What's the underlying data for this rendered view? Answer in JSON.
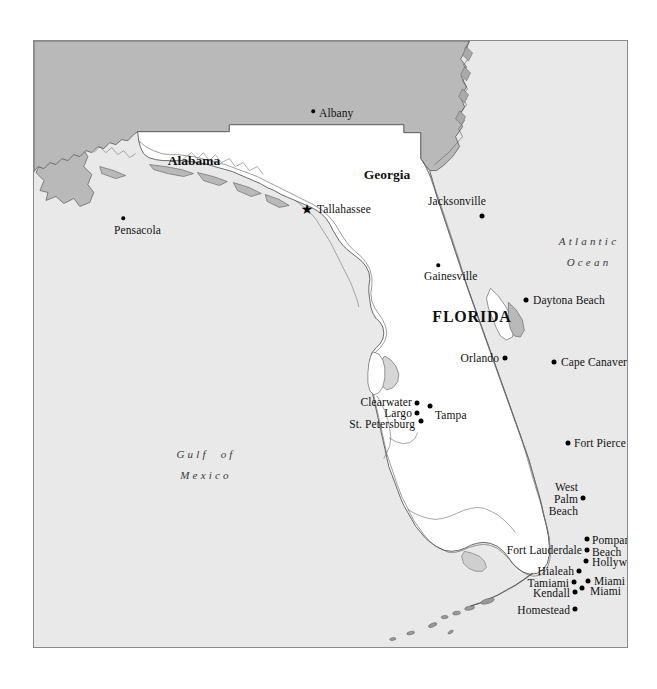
{
  "map": {
    "title": "Florida",
    "frame": {
      "x": 33,
      "y": 40,
      "width": 595,
      "height": 608
    },
    "colors": {
      "water": "#e9e9e9",
      "florida_land": "#ffffff",
      "neighbor_state": "#b9b9b9",
      "outline": "#595959",
      "frame_border": "#8a8a8a",
      "text": "#111111",
      "water_text": "#3a3a3a"
    },
    "state_labels": [
      {
        "name": "alabama",
        "text": "Alabama",
        "x": 160,
        "y": 112,
        "style": "neighbor"
      },
      {
        "name": "georgia",
        "text": "Georgia",
        "x": 353,
        "y": 126,
        "style": "neighbor"
      },
      {
        "name": "florida",
        "text": "FLORIDA",
        "x": 438,
        "y": 267,
        "style": "primary"
      }
    ],
    "water_labels": [
      {
        "name": "atlantic-ocean",
        "line1": "Atlantic",
        "line2": "Ocean",
        "x": 555,
        "y": 190
      },
      {
        "name": "gulf-of-mexico",
        "line1": "Gulf  of",
        "line2": "Mexico",
        "x": 172,
        "y": 403
      }
    ],
    "capital": {
      "name": "tallahassee",
      "label": "Tallahassee",
      "marker": "star",
      "dot_x": 273,
      "dot_y": 168,
      "label_x": 283,
      "label_y": 162,
      "align": "left"
    },
    "cities": [
      {
        "name": "albany",
        "label": "Albany",
        "dot_x": 279,
        "dot_y": 70,
        "label_x": 285,
        "label_y": 66,
        "align": "left",
        "size": "small"
      },
      {
        "name": "jacksonville",
        "label": "Jacksonville",
        "dot_x": 448,
        "dot_y": 175,
        "label_x": 394,
        "label_y": 154,
        "align": "left"
      },
      {
        "name": "pensacola",
        "label": "Pensacola",
        "dot_x": 89,
        "dot_y": 177,
        "label_x": 80,
        "label_y": 183,
        "align": "left",
        "size": "small"
      },
      {
        "name": "gainesville",
        "label": "Gainesville",
        "dot_x": 404,
        "dot_y": 224,
        "label_x": 390,
        "label_y": 229,
        "align": "left",
        "size": "small"
      },
      {
        "name": "daytona-beach",
        "label": "Daytona Beach",
        "dot_x": 492,
        "dot_y": 259,
        "label_x": 499,
        "label_y": 253,
        "align": "left"
      },
      {
        "name": "orlando",
        "label": "Orlando",
        "dot_x": 471,
        "dot_y": 317,
        "label_x": 465,
        "label_y": 311,
        "align": "right"
      },
      {
        "name": "cape-canaveral",
        "label": "Cape Canaveral",
        "dot_x": 520,
        "dot_y": 321,
        "label_x": 527,
        "label_y": 315,
        "align": "left"
      },
      {
        "name": "clearwater",
        "label": "Clearwater",
        "dot_x": 383,
        "dot_y": 362,
        "label_x": 378,
        "label_y": 355,
        "align": "right"
      },
      {
        "name": "tampa",
        "label": "Tampa",
        "dot_x": 396,
        "dot_y": 365,
        "label_x": 401,
        "label_y": 368,
        "align": "left"
      },
      {
        "name": "largo",
        "label": "Largo",
        "dot_x": 383,
        "dot_y": 372,
        "label_x": 378,
        "label_y": 366,
        "align": "right"
      },
      {
        "name": "st-petersburg",
        "label": "St. Petersburg",
        "dot_x": 387,
        "dot_y": 380,
        "label_x": 381,
        "label_y": 377,
        "align": "right"
      },
      {
        "name": "fort-pierce",
        "label": "Fort Pierce",
        "dot_x": 534,
        "dot_y": 402,
        "label_x": 540,
        "label_y": 396,
        "align": "left"
      },
      {
        "name": "west-palm-beach",
        "label": "West\nPalm\nBeach",
        "dot_x": 549,
        "dot_y": 457,
        "label_x": 544,
        "label_y": 440,
        "align": "right"
      },
      {
        "name": "pompano-beach",
        "label": "Pompano\nBeach",
        "dot_x": 553,
        "dot_y": 498,
        "label_x": 558,
        "label_y": 493,
        "align": "left"
      },
      {
        "name": "fort-lauderdale",
        "label": "Fort Lauderdale",
        "dot_x": 553,
        "dot_y": 509,
        "label_x": 548,
        "label_y": 503,
        "align": "right"
      },
      {
        "name": "hollywood",
        "label": "Hollywood",
        "dot_x": 552,
        "dot_y": 520,
        "label_x": 558,
        "label_y": 515,
        "align": "left"
      },
      {
        "name": "hialeah",
        "label": "Hialeah",
        "dot_x": 545,
        "dot_y": 530,
        "label_x": 540,
        "label_y": 524,
        "align": "right"
      },
      {
        "name": "miami-beach",
        "label": "Miami Beach",
        "dot_x": 554,
        "dot_y": 540,
        "label_x": 560,
        "label_y": 534,
        "align": "left"
      },
      {
        "name": "tamiami",
        "label": "Tamiami",
        "dot_x": 540,
        "dot_y": 541,
        "label_x": 535,
        "label_y": 536,
        "align": "right"
      },
      {
        "name": "miami",
        "label": "Miami",
        "dot_x": 548,
        "dot_y": 547,
        "label_x": 556,
        "label_y": 544,
        "align": "left"
      },
      {
        "name": "kendall",
        "label": "Kendall",
        "dot_x": 541,
        "dot_y": 551,
        "label_x": 536,
        "label_y": 546,
        "align": "right"
      },
      {
        "name": "homestead",
        "label": "Homestead",
        "dot_x": 541,
        "dot_y": 568,
        "label_x": 536,
        "label_y": 563,
        "align": "right"
      },
      {
        "name": "key-west",
        "label": "Key West",
        "dot_x": 439,
        "dot_y": 641,
        "label_x": 435,
        "label_y": 628,
        "align": "right"
      }
    ]
  }
}
